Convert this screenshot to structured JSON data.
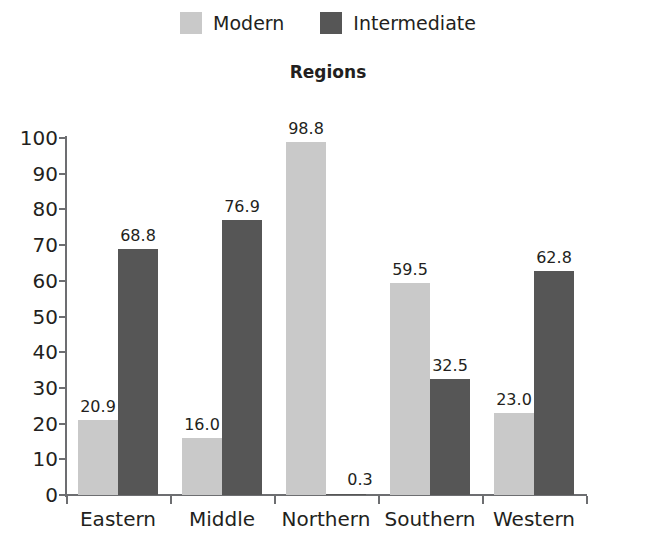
{
  "chart_data": {
    "type": "bar",
    "title": "Regions",
    "xlabel": "",
    "ylabel": "",
    "ylim": [
      0,
      100
    ],
    "ytick_labels": [
      "100",
      "90",
      "80",
      "70",
      "60",
      "50",
      "40",
      "30",
      "20",
      "10",
      "0"
    ],
    "yticks": [
      100,
      90,
      80,
      70,
      60,
      50,
      40,
      30,
      20,
      10,
      0
    ],
    "grid": false,
    "legend_position": "top-center",
    "categories": [
      "Eastern",
      "Middle",
      "Northern",
      "Southern",
      "Western"
    ],
    "series": [
      {
        "name": "Modern",
        "color": "#c9c9c9",
        "values": [
          20.9,
          16.0,
          98.8,
          59.5,
          23.0
        ],
        "labels": [
          "20.9",
          "16.0",
          "98.8",
          "59.5",
          "23.0"
        ]
      },
      {
        "name": "Intermediate",
        "color": "#565656",
        "values": [
          68.8,
          76.9,
          0.3,
          32.5,
          62.8
        ],
        "labels": [
          "68.8",
          "76.9",
          "0.3",
          "32.5",
          "62.8"
        ]
      }
    ]
  },
  "legend": {
    "entries": [
      {
        "label": "Modern",
        "color": "#c9c9c9"
      },
      {
        "label": "Intermediate",
        "color": "#565656"
      }
    ]
  },
  "axis": {
    "line_color": "#6d6e71"
  }
}
